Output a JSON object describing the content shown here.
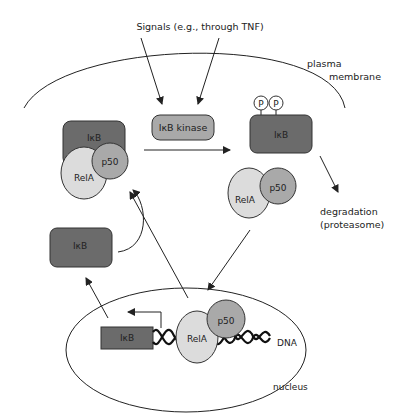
{
  "diagram": {
    "labels": {
      "signals": "Signals (e.g., through TNF)",
      "plasma_membrane_1": "plasma",
      "plasma_membrane_2": "membrane",
      "ikb_kinase": "IκB kinase",
      "ikb": "IκB",
      "rela": "RelA",
      "p50": "p50",
      "phospho": "P",
      "degradation_1": "degradation",
      "degradation_2": "(proteasome)",
      "dna": "DNA",
      "nucleus": "nucleus"
    },
    "colors": {
      "ikb_dark": "#6b6b6b",
      "kinase_p50_medium": "#a9a9a9",
      "rela_light": "#dcdcdc",
      "line": "#222222"
    }
  }
}
